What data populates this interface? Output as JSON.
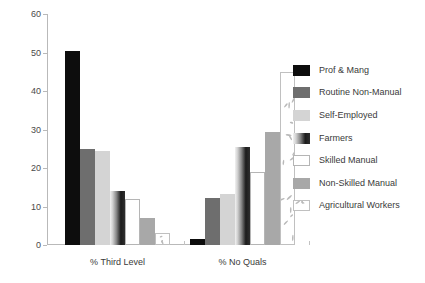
{
  "chart_data": {
    "type": "bar",
    "title": "",
    "xlabel": "",
    "ylabel": "",
    "ylim": [
      0,
      60
    ],
    "yticks": [
      0,
      10,
      20,
      30,
      40,
      50,
      60
    ],
    "grid": false,
    "legend_position": "right",
    "categories": [
      "% Third Level",
      "% No Quals"
    ],
    "series": [
      {
        "name": "Prof & Mang",
        "color": "#0d0d0d",
        "values": [
          50.5,
          1.5
        ]
      },
      {
        "name": "Routine Non-Manual",
        "color": "#6e6e6e",
        "values": [
          25.0,
          12.3
        ]
      },
      {
        "name": "Self-Employed",
        "color": "#d4d4d4",
        "values": [
          24.5,
          13.3
        ]
      },
      {
        "name": "Farmers",
        "color": "#8a8a8a",
        "values": [
          14.0,
          25.5
        ]
      },
      {
        "name": "Skilled Manual",
        "color": "#ffffff",
        "values": [
          12.0,
          19.0
        ]
      },
      {
        "name": "Non-Skilled Manual",
        "color": "#a8a8a8",
        "values": [
          7.0,
          29.3
        ]
      },
      {
        "name": "Agricultural Workers",
        "color": "#ffffff",
        "values": [
          3.0,
          45.0
        ]
      }
    ]
  },
  "legend": {
    "items": [
      {
        "label": "Prof & Mang",
        "swatch": "black-swatch"
      },
      {
        "label": "Routine Non-Manual",
        "swatch": "midgray-swatch"
      },
      {
        "label": "Self-Employed",
        "swatch": "lightgray-swatch"
      },
      {
        "label": "Farmers",
        "swatch": "gradient-swatch"
      },
      {
        "label": "Skilled Manual",
        "swatch": "white-swatch"
      },
      {
        "label": "Non-Skilled Manual",
        "swatch": "gray-swatch"
      },
      {
        "label": "Agricultural Workers",
        "swatch": "speckle-swatch"
      }
    ]
  }
}
